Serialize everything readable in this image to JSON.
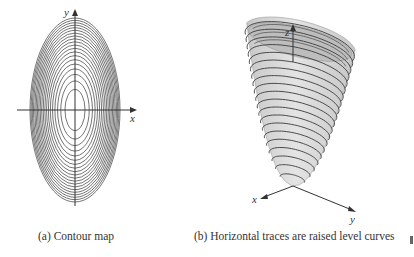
{
  "figures": [
    {
      "id": "a",
      "caption": "(a) Contour map",
      "type": "contour-map",
      "axes": {
        "x_label": "x",
        "y_label": "y"
      },
      "center": [
        75,
        110
      ],
      "outer_radii": [
        45,
        92
      ],
      "level_count": 20
    },
    {
      "id": "b",
      "caption": "(b) Horizontal traces are raised level curves",
      "type": "3d-paraboloid",
      "axes": {
        "x_label": "x",
        "y_label": "y",
        "z_label": "z"
      },
      "trace_count": 20
    }
  ],
  "colors": {
    "line": "#3a3a3a",
    "surface": "#d4d4d4",
    "surface_inner": "#b8b8b8",
    "background": "#ffffff"
  }
}
